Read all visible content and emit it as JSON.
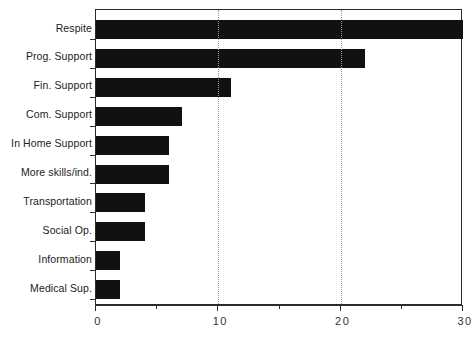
{
  "chart_data": {
    "type": "bar",
    "orientation": "horizontal",
    "title": "",
    "subtitle": "",
    "xlabel": "",
    "ylabel": "",
    "xlim": [
      0,
      30
    ],
    "xticks": [
      0,
      10,
      20,
      30
    ],
    "xtick_labels": [
      "0",
      "10",
      "20",
      "30"
    ],
    "minor_xticks": [
      5,
      15,
      25
    ],
    "grid": "vertical dotted gridlines at 10 and 20",
    "gridlines": [
      10,
      20
    ],
    "legend": null,
    "bar_color": "#111111",
    "axis_color": "#2b2b2b",
    "categories": [
      "Respite",
      "Prog. Support",
      "Fin. Support",
      "Com. Support",
      "In Home Support",
      "More skills/ind.",
      "Transportation",
      "Social Op.",
      "Information",
      "Medical Sup."
    ],
    "values": [
      30,
      22,
      11,
      7,
      6,
      6,
      4,
      4,
      2,
      2
    ]
  }
}
